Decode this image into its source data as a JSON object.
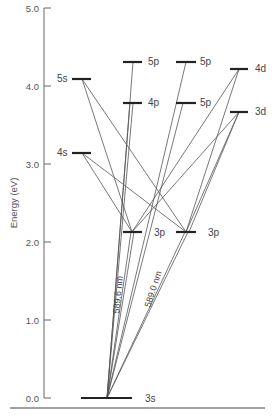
{
  "diagram": {
    "y_axis": {
      "label": "Energy (eV)",
      "ticks": [
        {
          "value": "5.0",
          "y": 8
        },
        {
          "value": "4.0",
          "y": 86
        },
        {
          "value": "3.0",
          "y": 164
        },
        {
          "value": "2.0",
          "y": 242
        },
        {
          "value": "1.0",
          "y": 320
        },
        {
          "value": "0.0",
          "y": 398
        }
      ]
    },
    "levels": [
      {
        "id": "3s",
        "label": "3s",
        "x1": 81,
        "x2": 132,
        "y": 398,
        "lx": 145,
        "ly": 402
      },
      {
        "id": "5s",
        "label": "5s",
        "x1": 72,
        "x2": 91,
        "y": 79,
        "lx": 57,
        "ly": 82
      },
      {
        "id": "4s",
        "label": "4s",
        "x1": 72,
        "x2": 91,
        "y": 153,
        "lx": 57,
        "ly": 156
      },
      {
        "id": "5p_a",
        "label": "5p",
        "x1": 123,
        "x2": 142,
        "y": 62,
        "lx": 148,
        "ly": 65
      },
      {
        "id": "4p_a",
        "label": "4p",
        "x1": 123,
        "x2": 142,
        "y": 103,
        "lx": 148,
        "ly": 106
      },
      {
        "id": "3p_a",
        "label": "3p",
        "x1": 123,
        "x2": 142,
        "y": 232,
        "lx": 154,
        "ly": 236
      },
      {
        "id": "5p_b",
        "label": "5p",
        "x1": 176,
        "x2": 196,
        "y": 62,
        "lx": 200,
        "ly": 65
      },
      {
        "id": "5p_b2",
        "label": "5p",
        "x1": 176,
        "x2": 196,
        "y": 103,
        "lx": 200,
        "ly": 106
      },
      {
        "id": "3p_b",
        "label": "3p",
        "x1": 176,
        "x2": 196,
        "y": 232,
        "lx": 208,
        "ly": 236
      },
      {
        "id": "4d",
        "label": "4d",
        "x1": 230,
        "x2": 248,
        "y": 69,
        "lx": 255,
        "ly": 72
      },
      {
        "id": "3d",
        "label": "3d",
        "x1": 230,
        "x2": 248,
        "y": 112,
        "lx": 255,
        "ly": 115
      }
    ],
    "transitions": [
      {
        "from": [
          107,
          398
        ],
        "to": [
          133,
          62
        ]
      },
      {
        "from": [
          107,
          398
        ],
        "to": [
          130,
          103
        ]
      },
      {
        "from": [
          107,
          398
        ],
        "to": [
          133,
          103
        ]
      },
      {
        "from": [
          107,
          398
        ],
        "to": [
          131,
          232
        ]
      },
      {
        "from": [
          107,
          398
        ],
        "to": [
          134,
          232
        ]
      },
      {
        "from": [
          107,
          398
        ],
        "to": [
          186,
          62
        ]
      },
      {
        "from": [
          107,
          398
        ],
        "to": [
          183,
          103
        ]
      },
      {
        "from": [
          107,
          398
        ],
        "to": [
          185,
          232
        ]
      },
      {
        "from": [
          107,
          398
        ],
        "to": [
          188,
          232
        ]
      },
      {
        "from": [
          82,
          79
        ],
        "to": [
          132,
          232
        ]
      },
      {
        "from": [
          82,
          79
        ],
        "to": [
          186,
          232
        ]
      },
      {
        "from": [
          82,
          153
        ],
        "to": [
          132,
          232
        ]
      },
      {
        "from": [
          82,
          153
        ],
        "to": [
          186,
          232
        ]
      },
      {
        "from": [
          239,
          69
        ],
        "to": [
          132,
          232
        ]
      },
      {
        "from": [
          239,
          69
        ],
        "to": [
          186,
          232
        ]
      },
      {
        "from": [
          239,
          112
        ],
        "to": [
          132,
          232
        ]
      },
      {
        "from": [
          239,
          112
        ],
        "to": [
          186,
          232
        ]
      },
      {
        "from": [
          239,
          112
        ],
        "to": [
          189,
          232
        ]
      }
    ],
    "wavelength_labels": [
      {
        "text": "589.6 nm",
        "x": 121,
        "y": 295,
        "rotate": -84
      },
      {
        "text": "589.0 nm",
        "x": 156,
        "y": 290,
        "rotate": -72
      }
    ],
    "baseline": {
      "x1": 10,
      "x2": 265,
      "y": 408
    }
  }
}
